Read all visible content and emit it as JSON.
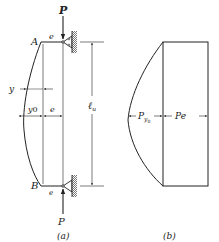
{
  "figure": {
    "panel_a": {
      "caption": "(a)",
      "labels": {
        "load_top": "P",
        "load_bottom": "P",
        "point_top": "A",
        "point_bottom": "B",
        "eccentricity_top": "e",
        "eccentricity_bottom": "e",
        "deflection": "y",
        "max_deflection": "y",
        "max_deflection_sub": "0",
        "eccentricity_dim": "e",
        "length": "ℓ",
        "length_sub": "u"
      }
    },
    "panel_b": {
      "caption": "(b)",
      "labels": {
        "moment_deflection": "P",
        "moment_deflection_sub": "y",
        "moment_deflection_subsub": "0",
        "moment_eccentric": "Pe"
      }
    }
  },
  "colors": {
    "ink": "#222222",
    "hatch": "#555555",
    "background": "#ffffff"
  }
}
